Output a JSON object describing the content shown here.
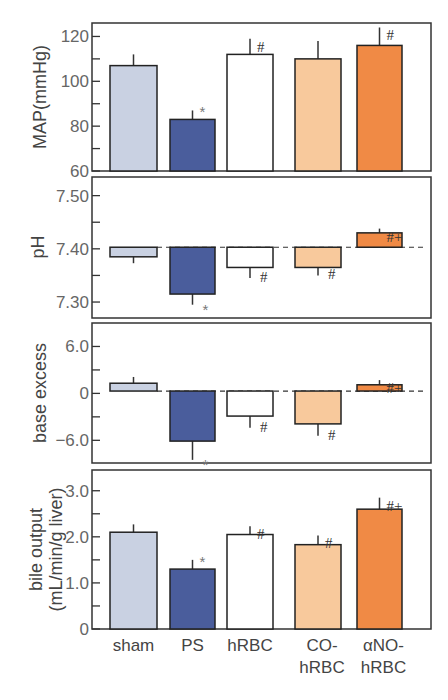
{
  "chart_data": [
    {
      "type": "bar",
      "id": "map",
      "ylabel": "MAP(mmHg)",
      "categories": [
        "sham",
        "PS",
        "hRBC",
        "CO-hRBC",
        "αNO-hRBC"
      ],
      "values": [
        107,
        83,
        112,
        110,
        116
      ],
      "errors": [
        5,
        4,
        7,
        8,
        8
      ],
      "significance": [
        "",
        "*",
        "#",
        "",
        "#"
      ],
      "baseline": 60,
      "ylim": [
        60,
        126
      ],
      "yticks": [
        60,
        70,
        80,
        90,
        100,
        110,
        120
      ],
      "ytick_labels": {
        "60": "60",
        "80": "80",
        "100": "100",
        "120": "120"
      },
      "reference_line": null
    },
    {
      "type": "bar",
      "id": "ph",
      "ylabel": "pH",
      "categories": [
        "sham",
        "PS",
        "hRBC",
        "CO-hRBC",
        "αNO-hRBC"
      ],
      "values": [
        7.385,
        7.315,
        7.365,
        7.365,
        7.43
      ],
      "errors": [
        0.012,
        0.02,
        0.02,
        0.015,
        0.008
      ],
      "significance": [
        "",
        "*",
        "#",
        "#",
        "#+"
      ],
      "baseline": 7.403,
      "ylim": [
        7.27,
        7.535
      ],
      "yticks": [
        7.3,
        7.35,
        7.4,
        7.45,
        7.5
      ],
      "ytick_labels": {
        "7.3": "7.30",
        "7.4": "7.40",
        "7.5": "7.50"
      },
      "reference_line": 7.403
    },
    {
      "type": "bar",
      "id": "base_excess",
      "ylabel": "base excess",
      "categories": [
        "sham",
        "PS",
        "hRBC",
        "CO-hRBC",
        "αNO-hRBC"
      ],
      "values": [
        1.3,
        -6.1,
        -2.9,
        -3.9,
        1.1
      ],
      "errors": [
        0.8,
        2.4,
        1.5,
        1.5,
        0.6
      ],
      "significance": [
        "",
        "*",
        "#",
        "#",
        "#+"
      ],
      "baseline": 0.3,
      "ylim": [
        -8.9,
        9.0
      ],
      "yticks": [
        -6.0,
        -3.0,
        0,
        3.0,
        6.0
      ],
      "ytick_labels": {
        "-6": "−6.0",
        "0": "0",
        "6": "6.0"
      },
      "reference_line": 0.3
    },
    {
      "type": "bar",
      "id": "bile_output",
      "ylabel": "bile output",
      "ylabel2": "(mL/min/g liver)",
      "categories": [
        "sham",
        "PS",
        "hRBC",
        "CO-hRBC",
        "αNO-hRBC"
      ],
      "values": [
        2.1,
        1.3,
        2.05,
        1.83,
        2.6
      ],
      "errors": [
        0.17,
        0.2,
        0.18,
        0.2,
        0.25
      ],
      "significance": [
        "",
        "*",
        "#",
        "#",
        "#+"
      ],
      "baseline": 0,
      "ylim": [
        0,
        3.45
      ],
      "yticks": [
        0,
        0.5,
        1.0,
        1.5,
        2.0,
        2.5,
        3.0
      ],
      "ytick_labels": {
        "0": "0",
        "1": "1.0",
        "2": "2.0",
        "3": "3.0"
      },
      "reference_line": null
    }
  ],
  "x_axis": {
    "category_labels": [
      [
        "sham"
      ],
      [
        "PS"
      ],
      [
        "hRBC"
      ],
      [
        "CO-",
        "hRBC"
      ],
      [
        "αNO-",
        "hRBC"
      ]
    ]
  },
  "colors": {
    "sham": "#c9d1e2",
    "PS": "#4a5d9c",
    "hRBC": "#ffffff",
    "CO-hRBC": "#f8c99c",
    "αNO-hRBC": "#f08a45",
    "frame": "#333333",
    "tick_text": "#666666"
  }
}
